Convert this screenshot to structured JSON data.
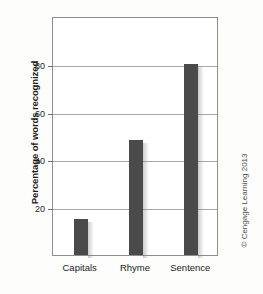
{
  "chart_data": {
    "type": "bar",
    "title": "",
    "xlabel": "",
    "ylabel": "Percentage of words recognized",
    "categories": [
      "Capitals",
      "Rhyme",
      "Sentence"
    ],
    "values": [
      15,
      48,
      80
    ],
    "ylim": [
      0,
      100
    ],
    "yticks": [
      20,
      40,
      60,
      80
    ],
    "ytick_labels": [
      "20",
      "40",
      "60",
      "80"
    ],
    "grid": true,
    "legend": false,
    "bar_color": "#4a4a4a",
    "frame_color": "#8e8e8e",
    "gridline_color": "#a9a9a9"
  },
  "credit": {
    "text": "© Cengage Learning 2013"
  }
}
